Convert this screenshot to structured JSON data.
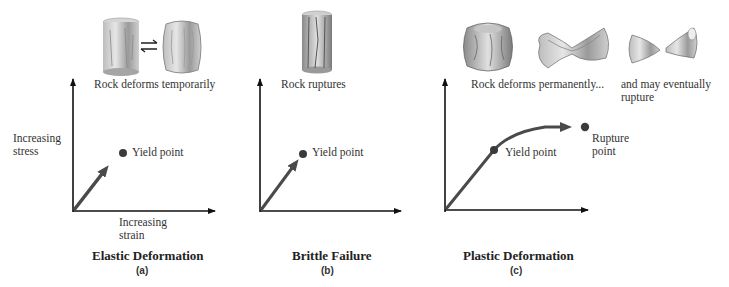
{
  "panels": [
    {
      "id": "a",
      "title": "Elastic Deformation",
      "sub": "(a)",
      "captions": [
        "Rock deforms temporarily"
      ],
      "point_labels": [
        "Yield point"
      ],
      "axis_labels": {
        "y": [
          "Increasing",
          "stress"
        ],
        "x": [
          "Increasing",
          "strain"
        ]
      }
    },
    {
      "id": "b",
      "title": "Brittle Failure",
      "sub": "(b)",
      "captions": [
        "Rock ruptures"
      ],
      "point_labels": [
        "Yield point"
      ]
    },
    {
      "id": "c",
      "title": "Plastic Deformation",
      "sub": "(c)",
      "captions": [
        "Rock deforms permanently...",
        "and may eventually",
        "rupture"
      ],
      "point_labels": [
        "Yield point",
        "Rupture",
        "point"
      ]
    }
  ],
  "colors": {
    "axis": "#111111",
    "curve": "#4a4a4a",
    "point": "#3a3a3a",
    "rock_light": "#d8d8d8",
    "rock_dark": "#7a7a7a"
  }
}
